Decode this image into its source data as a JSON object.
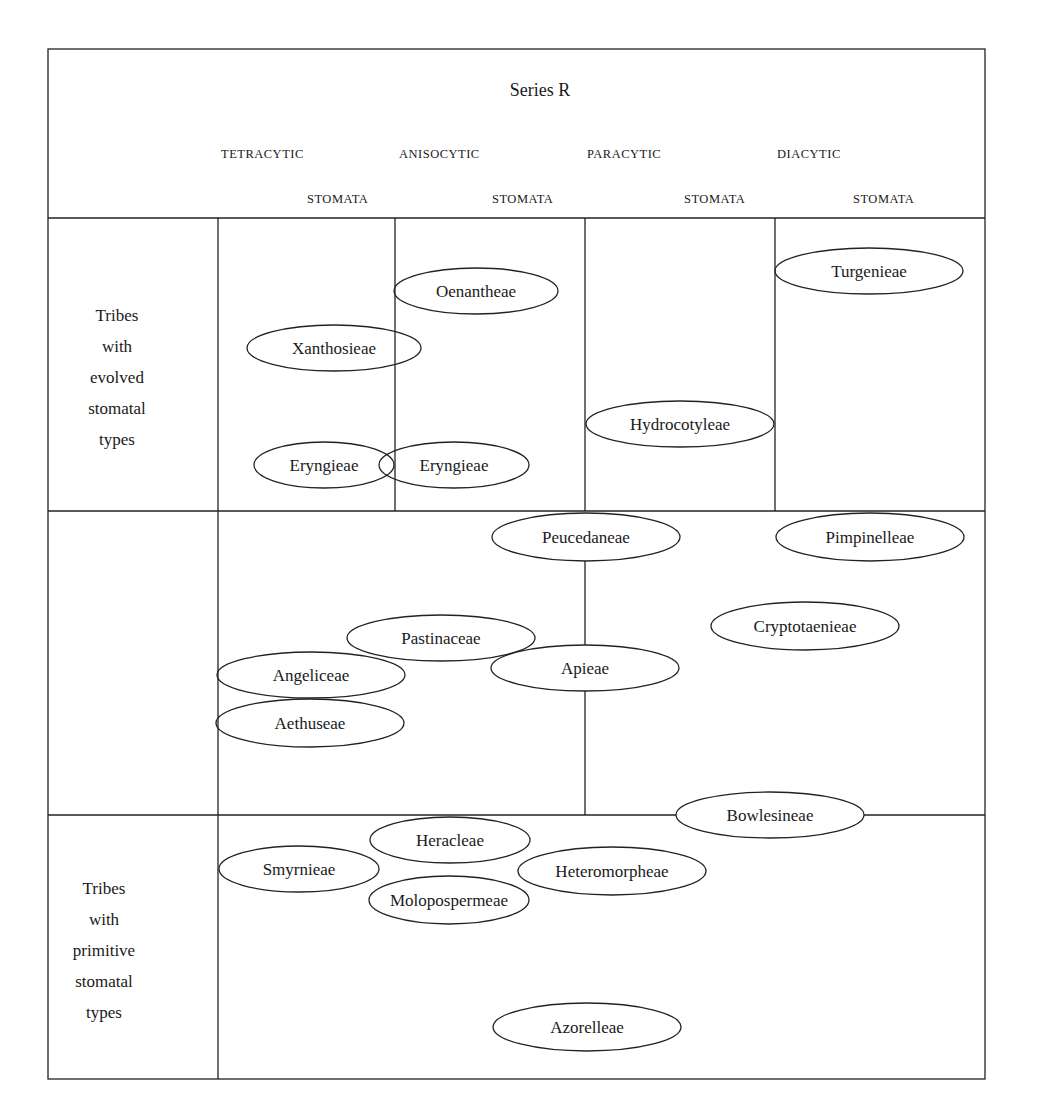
{
  "series_title": "Series R",
  "columns": {
    "header_row1": [
      "TETRACYTIC",
      "ANISOCYTIC",
      "PARACYTIC",
      "DIACYTIC"
    ],
    "header_row2": [
      "STOMATA",
      "STOMATA",
      "STOMATA",
      "STOMATA"
    ]
  },
  "row_labels": {
    "evolved": [
      "Tribes",
      "with",
      "evolved",
      "stomatal",
      "types"
    ],
    "primitive": [
      "Tribes",
      "with",
      "primitive",
      "stomatal",
      "types"
    ]
  },
  "tribes": [
    {
      "name": "Oenantheae",
      "cx": 476,
      "cy": 291,
      "rx": 82,
      "ry": 23
    },
    {
      "name": "Turgenieae",
      "cx": 869,
      "cy": 271,
      "rx": 94,
      "ry": 23
    },
    {
      "name": "Xanthosieae",
      "cx": 334,
      "cy": 348,
      "rx": 87,
      "ry": 23
    },
    {
      "name": "Hydrocotyleae",
      "cx": 680,
      "cy": 424,
      "rx": 94,
      "ry": 23
    },
    {
      "name": "Eryngieae",
      "cx": 324,
      "cy": 465,
      "rx": 70,
      "ry": 23
    },
    {
      "name": "Eryngieae",
      "cx": 454,
      "cy": 465,
      "rx": 75,
      "ry": 23
    },
    {
      "name": "Peucedaneae",
      "cx": 586,
      "cy": 537,
      "rx": 94,
      "ry": 24
    },
    {
      "name": "Pimpinelleae",
      "cx": 870,
      "cy": 537,
      "rx": 94,
      "ry": 24
    },
    {
      "name": "Cryptotaenieae",
      "cx": 805,
      "cy": 626,
      "rx": 94,
      "ry": 24
    },
    {
      "name": "Pastinaceae",
      "cx": 441,
      "cy": 638,
      "rx": 94,
      "ry": 23
    },
    {
      "name": "Apieae",
      "cx": 585,
      "cy": 668,
      "rx": 94,
      "ry": 23
    },
    {
      "name": "Angeliceae",
      "cx": 311,
      "cy": 675,
      "rx": 94,
      "ry": 23
    },
    {
      "name": "Aethuseae",
      "cx": 310,
      "cy": 723,
      "rx": 94,
      "ry": 24
    },
    {
      "name": "Bowlesineae",
      "cx": 770,
      "cy": 815,
      "rx": 94,
      "ry": 23
    },
    {
      "name": "Heracleae",
      "cx": 450,
      "cy": 840,
      "rx": 80,
      "ry": 23
    },
    {
      "name": "Smyrnieae",
      "cx": 299,
      "cy": 869,
      "rx": 80,
      "ry": 23
    },
    {
      "name": "Heteromorpheae",
      "cx": 612,
      "cy": 871,
      "rx": 94,
      "ry": 24
    },
    {
      "name": "Molopospermeae",
      "cx": 449,
      "cy": 900,
      "rx": 80,
      "ry": 24
    },
    {
      "name": "Azorelleae",
      "cx": 587,
      "cy": 1027,
      "rx": 94,
      "ry": 24
    }
  ]
}
